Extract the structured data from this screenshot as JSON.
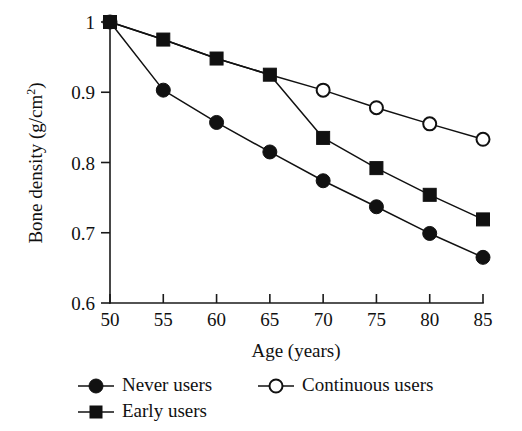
{
  "chart_data": {
    "type": "line",
    "title": "",
    "xlabel": "Age (years)",
    "ylabel": "Bone density (g/cm2)",
    "ylabel_main": "Bone density (g/",
    "ylabel_unit": "cm",
    "ylabel_exponent": "2",
    "ylabel_close": ")",
    "x": [
      50,
      55,
      60,
      65,
      70,
      75,
      80,
      85
    ],
    "xticklabels": [
      "50",
      "55",
      "60",
      "65",
      "70",
      "75",
      "80",
      "85"
    ],
    "yticks": [
      0.6,
      0.7,
      0.8,
      0.9,
      1.0
    ],
    "yticklabels": [
      "0.6",
      "0.7",
      "0.8",
      "0.9",
      "1"
    ],
    "xlim": [
      50,
      85
    ],
    "ylim": [
      0.6,
      1.0
    ],
    "grid": false,
    "legend_position": "below-axis",
    "series": [
      {
        "name": "Never users",
        "marker": "filled-circle",
        "x": [
          50,
          55,
          60,
          65,
          70,
          75,
          80,
          85
        ],
        "values": [
          1.0,
          0.903,
          0.857,
          0.815,
          0.774,
          0.737,
          0.699,
          0.665
        ]
      },
      {
        "name": "Early users",
        "marker": "filled-square",
        "x": [
          50,
          55,
          60,
          65,
          70,
          75,
          80,
          85
        ],
        "values": [
          1.0,
          0.975,
          0.948,
          0.925,
          0.835,
          0.792,
          0.754,
          0.719
        ]
      },
      {
        "name": "Continuous users",
        "marker": "open-circle",
        "x": [
          50,
          55,
          60,
          65,
          70,
          75,
          80,
          85
        ],
        "values": [
          1.0,
          0.975,
          0.948,
          0.925,
          0.903,
          0.878,
          0.855,
          0.833
        ],
        "marker_from_index": 4
      }
    ]
  },
  "legend": {
    "entries": [
      {
        "label": "Never users",
        "marker": "filled-circle"
      },
      {
        "label": "Continuous users",
        "marker": "open-circle"
      },
      {
        "label": "Early users",
        "marker": "filled-square"
      }
    ]
  },
  "colors": {
    "ink": "#111111",
    "background": "#ffffff",
    "marker_fill": "#111111",
    "marker_open_fill": "#ffffff"
  }
}
